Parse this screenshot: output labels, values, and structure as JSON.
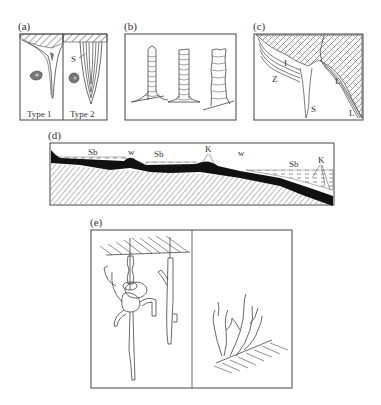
{
  "panels": {
    "a": {
      "label": "(a)",
      "sub_labels": {
        "type1": "Type 1",
        "type2": "Type 2",
        "s": "S"
      }
    },
    "b": {
      "label": "(b)"
    },
    "c": {
      "label": "(c)",
      "sub_labels": {
        "i": "I",
        "z": "Z",
        "s": "S",
        "l1": "L",
        "l2": "L"
      }
    },
    "d": {
      "label": "(d)",
      "sub_labels": {
        "sb1": "Sb",
        "w1": "w",
        "sb2": "Sb",
        "k1": "K",
        "w2": "w",
        "sb3": "Sb",
        "k2": "K"
      }
    },
    "e": {
      "label": "(e)"
    }
  }
}
